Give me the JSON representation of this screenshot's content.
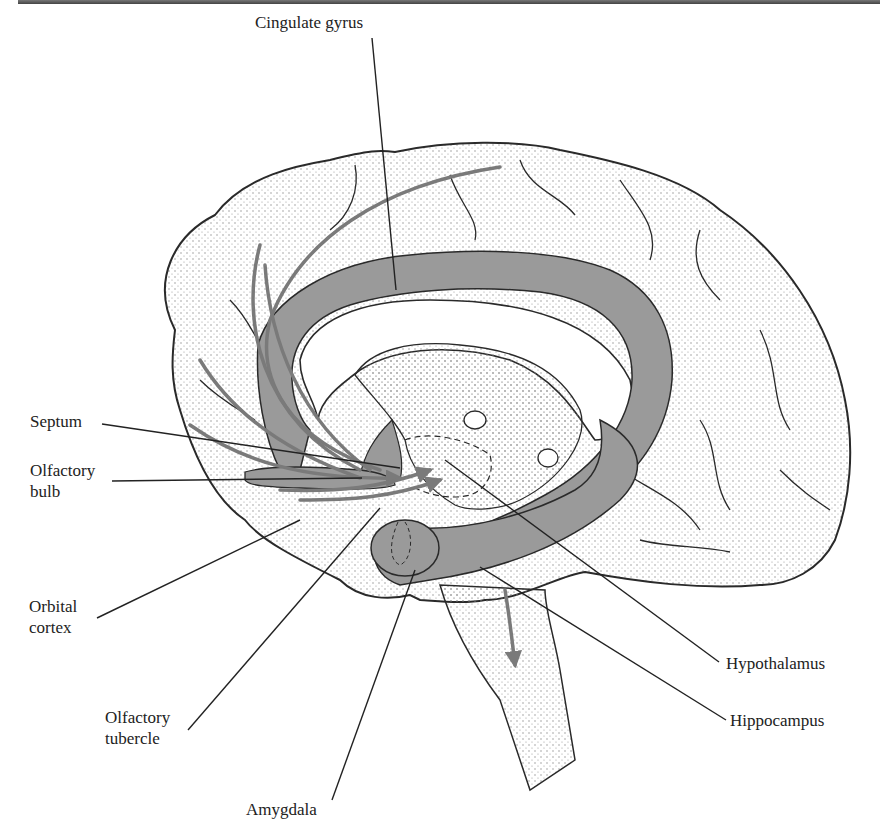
{
  "diagram": {
    "colors": {
      "limbic_fill": "#9a9a9a",
      "outline": "#2a2a2a",
      "stipple": "#8a8a8a",
      "pathway_arrows": "#7a7a7a",
      "background": "#ffffff"
    },
    "labels": {
      "cingulate_gyrus": "Cingulate gyrus",
      "septum": "Septum",
      "olfactory_bulb_1": "Olfactory",
      "olfactory_bulb_2": "bulb",
      "orbital_cortex_1": "Orbital",
      "orbital_cortex_2": "cortex",
      "olfactory_tubercle_1": "Olfactory",
      "olfactory_tubercle_2": "tubercle",
      "amygdala": "Amygdala",
      "hypothalamus": "Hypothalamus",
      "hippocampus": "Hippocampus"
    }
  }
}
